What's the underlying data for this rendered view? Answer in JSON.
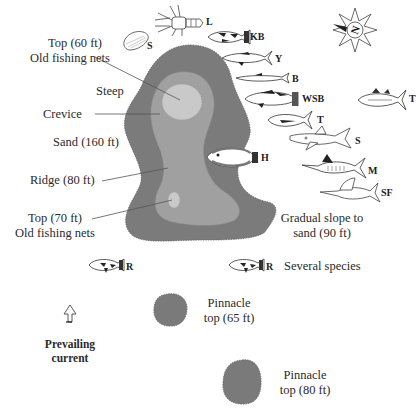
{
  "colors": {
    "reef_outer": "#7b7b7b",
    "reef_middle": "#a0a0a0",
    "reef_inner": "#c9c9c9",
    "pinnacle": "#7a7a7a",
    "text": "#2a2a2a"
  },
  "reef_labels": {
    "top60": "Top (60 ft)",
    "top60_note": "Old fishing nets",
    "steep": "Steep",
    "crevice": "Crevice",
    "sand": "Sand (160 ft)",
    "ridge": "Ridge (80 ft)",
    "top70": "Top (70 ft)",
    "top70_note": "Old fishing nets",
    "slope_line1": "Gradual slope to",
    "slope_line2": "sand (90 ft)",
    "several": "Several species"
  },
  "pinnacles": [
    {
      "line1": "Pinnacle",
      "line2": "top (65 ft)"
    },
    {
      "line1": "Pinnacle",
      "line2": "top (80 ft)"
    }
  ],
  "current": {
    "icon": "up-arrow-icon",
    "line1": "Prevailing",
    "line2": "current"
  },
  "compass": {
    "icon": "compass-rose-icon",
    "north_label": "N"
  },
  "species": [
    {
      "code": "S",
      "icon": "scallop-shell-icon"
    },
    {
      "code": "L",
      "icon": "lobster-icon"
    },
    {
      "code": "KB",
      "icon": "fish-icon"
    },
    {
      "code": "Y",
      "icon": "fish-icon"
    },
    {
      "code": "B",
      "icon": "fish-icon"
    },
    {
      "code": "WSB",
      "icon": "fish-icon"
    },
    {
      "code": "T",
      "icon": "tuna-icon"
    },
    {
      "code": "T",
      "icon": "tuna-icon"
    },
    {
      "code": "S",
      "icon": "shark-icon"
    },
    {
      "code": "H",
      "icon": "flounder-icon"
    },
    {
      "code": "M",
      "icon": "marlin-icon"
    },
    {
      "code": "SF",
      "icon": "sailfish-icon"
    },
    {
      "code": "R",
      "icon": "fish-icon"
    },
    {
      "code": "R",
      "icon": "fish-icon"
    }
  ]
}
